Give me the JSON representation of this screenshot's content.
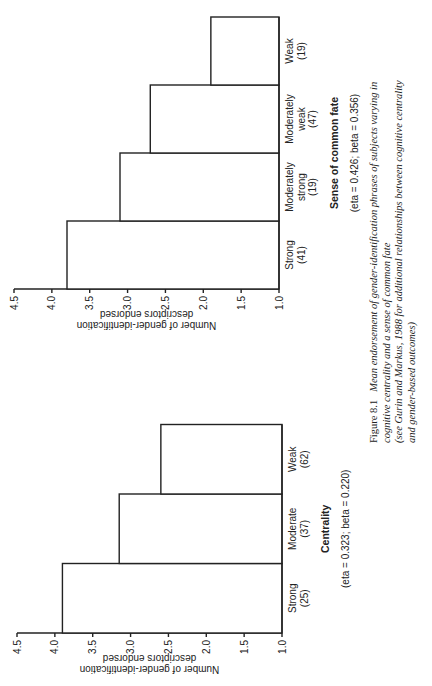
{
  "caption": {
    "figure_number": "Figure 8.1",
    "line1": "Mean endorsement of gender-identification phrases of subjects varying in",
    "line2": "cognitive centrality and a sense of common fate",
    "line3": "(see Gurin and Markus, 1988 for additional relationships between cognitive centrality",
    "line4": "and gender-based outcomes)"
  },
  "chart_data": [
    {
      "id": "centrality",
      "type": "bar",
      "title": "Centrality",
      "stats": "(eta = 0.323; beta = 0.220)",
      "ylabel_line1": "Number of gender-identification",
      "ylabel_line2": "descriptors endorsed",
      "xlabel": "Centrality",
      "ylim": [
        1.0,
        4.5
      ],
      "yticks": [
        "1.0",
        "1.5",
        "2.0",
        "2.5",
        "3.0",
        "3.5",
        "4.0",
        "4.5"
      ],
      "categories": [
        {
          "lines": [
            "Strong",
            "(25)"
          ]
        },
        {
          "lines": [
            "Moderate",
            "(37)"
          ]
        },
        {
          "lines": [
            "Weak",
            "(62)"
          ]
        }
      ],
      "values": [
        3.9,
        3.15,
        2.6
      ],
      "grid": false
    },
    {
      "id": "common-fate",
      "type": "bar",
      "title": "Sense of common fate",
      "stats": "(eta = 0.426; beta = 0.356)",
      "ylabel_line1": "Number of gender-identification",
      "ylabel_line2": "descriptors endorsed",
      "xlabel": "Sense of common fate",
      "ylim": [
        1.0,
        4.5
      ],
      "yticks": [
        "1.0",
        "1.5",
        "2.0",
        "2.5",
        "3.0",
        "3.5",
        "4.0",
        "4.5"
      ],
      "categories": [
        {
          "lines": [
            "Strong",
            "(41)"
          ]
        },
        {
          "lines": [
            "Moderately",
            "strong",
            "(19)"
          ]
        },
        {
          "lines": [
            "Moderately",
            "weak",
            "(47)"
          ]
        },
        {
          "lines": [
            "Weak",
            "(19)"
          ]
        }
      ],
      "values": [
        3.8,
        3.1,
        2.7,
        1.9
      ],
      "grid": false
    }
  ]
}
